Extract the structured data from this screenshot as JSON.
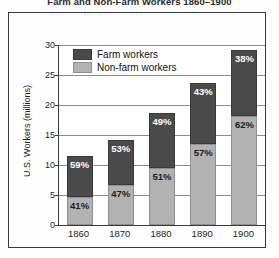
{
  "chart_data": {
    "type": "bar",
    "subtype": "stacked-bar-100-percent-labeled",
    "title": "Farm and Non-Farm Workers 1860–1900",
    "xlabel": "",
    "ylabel": "U.S. Workers (millions)",
    "ylim": [
      0,
      30
    ],
    "yticks": [
      0,
      5,
      10,
      15,
      20,
      25,
      30
    ],
    "ytick_labels": [
      "0",
      "5",
      "10",
      "15",
      "20",
      "25",
      "30"
    ],
    "grid": true,
    "grid_axis": "y",
    "legend_position": "top-left-inside",
    "categories": [
      "1860",
      "1870",
      "1880",
      "1890",
      "1900"
    ],
    "totals": [
      11.5,
      14.2,
      18.7,
      23.7,
      29.2
    ],
    "series": [
      {
        "name": "Non-farm workers",
        "color": "#b2b2b2",
        "stack_position": "bottom",
        "values": [
          4.7,
          6.7,
          9.5,
          13.5,
          18.1
        ],
        "percent_labels": [
          "41%",
          "47%",
          "51%",
          "57%",
          "62%"
        ]
      },
      {
        "name": "Farm workers",
        "color": "#4a4a4a",
        "stack_position": "top",
        "values": [
          6.8,
          7.5,
          9.2,
          10.2,
          11.1
        ],
        "percent_labels": [
          "59%",
          "53%",
          "49%",
          "43%",
          "38%"
        ]
      }
    ]
  },
  "legend": {
    "items": [
      {
        "label": "Farm workers",
        "swatch": "farm"
      },
      {
        "label": "Non-farm workers",
        "swatch": "nonfarm"
      }
    ]
  },
  "colors": {
    "farm": "#4a4a4a",
    "nonfarm": "#b2b2b2",
    "frame": "#3a3a3a",
    "grid": "#8c8c8c",
    "text": "#1c1c1c",
    "background": "#ffffff"
  }
}
